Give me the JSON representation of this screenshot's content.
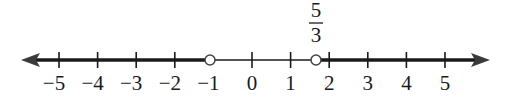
{
  "diagram": {
    "type": "number_line",
    "colors": {
      "line": "#1a1a1a",
      "background": "#ffffff",
      "open_circle_fill": "#ffffff"
    },
    "range": [
      -5,
      5
    ],
    "ticks": [
      {
        "value": -5,
        "label": "−5"
      },
      {
        "value": -4,
        "label": "−4"
      },
      {
        "value": -3,
        "label": "−3"
      },
      {
        "value": -2,
        "label": "−2"
      },
      {
        "value": -1,
        "label": "−1"
      },
      {
        "value": 0,
        "label": "0"
      },
      {
        "value": 1,
        "label": "1"
      },
      {
        "value": 2,
        "label": "2"
      },
      {
        "value": 3,
        "label": "3"
      },
      {
        "value": 4,
        "label": "4"
      },
      {
        "value": 5,
        "label": "5"
      }
    ],
    "open_points": [
      {
        "value": -1,
        "label": ""
      },
      {
        "value": 1.6667,
        "label_numerator": "5",
        "label_denominator": "3"
      }
    ],
    "shaded_intervals": [
      {
        "from": "-infinity",
        "to": -1,
        "open_end": true
      },
      {
        "from": 1.6667,
        "to": "infinity",
        "open_start": true
      }
    ],
    "annotation": {
      "numerator": "5",
      "denominator": "3"
    }
  }
}
